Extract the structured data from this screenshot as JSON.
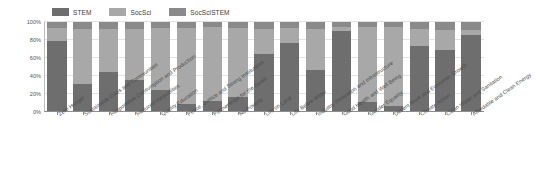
{
  "chart_data": {
    "type": "bar",
    "stacked": true,
    "normalized_percent": true,
    "title": "",
    "subtitle": "",
    "xlabel": "",
    "ylabel": "",
    "ylim": [
      0,
      100
    ],
    "ytick_labels": [
      "0%",
      "20%",
      "40%",
      "60%",
      "80%",
      "100%"
    ],
    "ytick_values": [
      0,
      20,
      40,
      60,
      80,
      100
    ],
    "grid": true,
    "legend_position": "top-left",
    "colors": {
      "STEM": "#6e6e6e",
      "SocSci": "#a8a8a8",
      "SocSciSTEM": "#8a8a8a"
    },
    "legend": [
      {
        "name": "STEM",
        "color": "#6e6e6e"
      },
      {
        "name": "SocSci",
        "color": "#a8a8a8"
      },
      {
        "name": "SocSciSTEM",
        "color": "#8a8a8a"
      }
    ],
    "categories": [
      "Zero Hunger",
      "Sustainable Cities and Communities",
      "Responsible Consumption and Production",
      "Reduced Inequalities",
      "Quality Education",
      "Peace, Justice and Strong Institutions",
      "Partnerships for the Goals",
      "No Poverty",
      "Life on Land",
      "Life Below Water",
      "Industry Innovation and Infrastructure",
      "Good Health and Well Being",
      "Gender Equality",
      "Decent Work and Economic Growth",
      "Climate Action",
      "Clean Water and Sanitation",
      "Affordable and Clean Energy"
    ],
    "series": [
      {
        "name": "STEM",
        "values": [
          79,
          31,
          45,
          36,
          25,
          9,
          12,
          17,
          65,
          77,
          47,
          90,
          11,
          7,
          73,
          69,
          86
        ]
      },
      {
        "name": "SocSci",
        "values": [
          14,
          61,
          47,
          56,
          68,
          84,
          82,
          76,
          27,
          16,
          45,
          4,
          83,
          88,
          19,
          22,
          5
        ]
      },
      {
        "name": "SocSciSTEM",
        "values": [
          7,
          8,
          8,
          8,
          7,
          7,
          6,
          7,
          8,
          7,
          8,
          6,
          6,
          5,
          8,
          9,
          9
        ]
      }
    ]
  }
}
